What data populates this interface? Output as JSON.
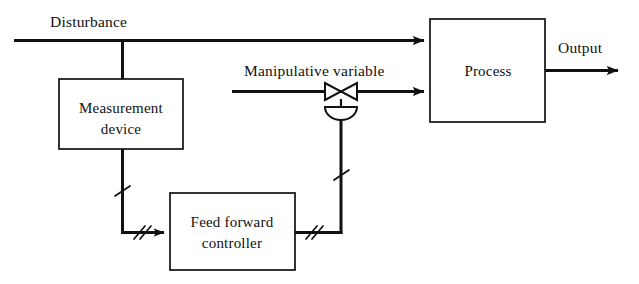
{
  "diagram": {
    "blocks": [
      {
        "id": "measurement_device",
        "label_line1": "Measurement",
        "label_line2": "device"
      },
      {
        "id": "feed_forward_controller",
        "label_line1": "Feed forward",
        "label_line2": "controller"
      },
      {
        "id": "process",
        "label_line1": "Process",
        "label_line2": ""
      }
    ],
    "signal_labels": {
      "disturbance": "Disturbance",
      "manipulative_variable": "Manipulative variable",
      "output": "Output"
    },
    "symbols": {
      "valve": "control-valve",
      "actuator": "diaphragm-actuator",
      "signal_break": "signal-hash-mark"
    },
    "colors": {
      "line": "#111111",
      "background": "#ffffff",
      "text": "#111111"
    }
  }
}
